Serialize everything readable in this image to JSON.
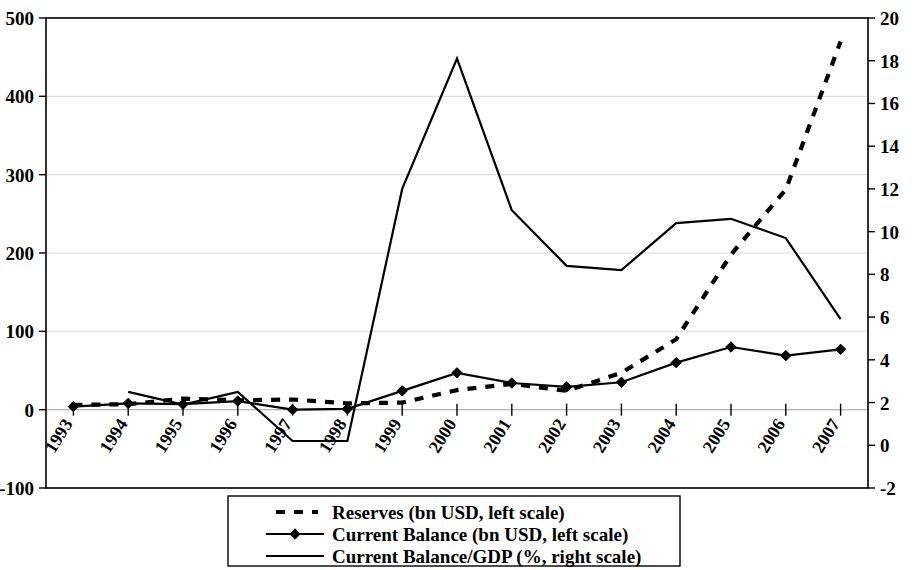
{
  "chart_data": {
    "type": "line",
    "title": "",
    "xlabel": "",
    "ylabel": "",
    "grid": true,
    "legend_position": "bottom",
    "categories": [
      "1993",
      "1994",
      "1995",
      "1996",
      "1997",
      "1998",
      "1999",
      "2000",
      "2001",
      "2002",
      "2003",
      "2004",
      "2005",
      "2006",
      "2007"
    ],
    "left_axis": {
      "label": "",
      "ylim": [
        -100,
        500
      ],
      "ticks": [
        -100,
        0,
        100,
        200,
        300,
        400,
        500
      ],
      "tick_labels": [
        "-100",
        "0",
        "100",
        "200",
        "300",
        "400",
        "500"
      ]
    },
    "right_axis": {
      "label": "",
      "ylim": [
        -2,
        20
      ],
      "ticks": [
        -2,
        0,
        2,
        4,
        6,
        8,
        10,
        12,
        14,
        16,
        18,
        20
      ],
      "tick_labels": [
        "-2",
        "0",
        "2",
        "4",
        "6",
        "8",
        "10",
        "12",
        "14",
        "16",
        "18",
        "20"
      ]
    },
    "series": [
      {
        "name": "Reserves (bn USD, left scale)",
        "axis": "left",
        "style": "dashed",
        "marker": "none",
        "color": "#000000",
        "values": [
          6,
          7,
          14,
          12,
          13,
          8,
          9,
          25,
          33,
          24,
          47,
          90,
          198,
          281,
          470
        ]
      },
      {
        "name": "Current Balance (bn USD, left scale)",
        "axis": "left",
        "style": "solid",
        "marker": "diamond",
        "color": "#000000",
        "values": [
          4,
          8,
          7,
          11,
          0,
          1,
          24,
          47,
          34,
          29,
          35,
          60,
          80,
          69,
          77
        ]
      },
      {
        "name": "Current Balance/GDP (%, right scale)",
        "axis": "right",
        "style": "solid",
        "marker": "none",
        "color": "#000000",
        "values": [
          null,
          2.5,
          1.9,
          2.5,
          0.2,
          0.2,
          12.0,
          18.1,
          11.0,
          8.4,
          8.2,
          10.4,
          10.6,
          9.7,
          5.9
        ]
      }
    ],
    "legend_entries": [
      {
        "label": "Reserves (bn USD, left scale)",
        "style": "dashed",
        "marker": "none"
      },
      {
        "label": "Current Balance (bn USD, left scale)",
        "style": "solid",
        "marker": "diamond"
      },
      {
        "label": "Current Balance/GDP (%, right scale)",
        "style": "solid",
        "marker": "none"
      }
    ]
  }
}
